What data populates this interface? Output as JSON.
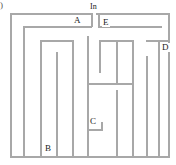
{
  "figure": {
    "corner_mark": ")",
    "entrance_label": "In"
  },
  "labels": [
    {
      "id": "A",
      "text": "A",
      "x": 73,
      "y": 16
    },
    {
      "id": "E",
      "text": "E",
      "x": 102,
      "y": 18
    },
    {
      "id": "D",
      "text": "D",
      "x": 161,
      "y": 43
    },
    {
      "id": "C",
      "text": "C",
      "x": 89,
      "y": 117
    },
    {
      "id": "B",
      "text": "B",
      "x": 44,
      "y": 144
    }
  ],
  "entrance": {
    "text": "In",
    "x": 89,
    "y": 3
  },
  "colors": {
    "wall": "#a8a8a8",
    "wall_light": "#c9c9c9",
    "background": "#ffffff",
    "text": "#1a1a1a"
  },
  "maze": {
    "type": "rectangular-maze",
    "width": 176,
    "height": 165,
    "outer_border": {
      "left": 10,
      "top": 13,
      "right": 170,
      "bottom": 158
    },
    "walls": [
      {
        "name": "outer-left",
        "orient": "v",
        "x": 10,
        "y": 13,
        "len": 145
      },
      {
        "name": "outer-top-left",
        "orient": "h",
        "x": 10,
        "y": 13,
        "len": 82
      },
      {
        "name": "outer-top-right",
        "orient": "h",
        "x": 96,
        "y": 13,
        "len": 74
      },
      {
        "name": "outer-right",
        "orient": "v",
        "x": 168,
        "y": 13,
        "len": 145
      },
      {
        "name": "outer-bottom",
        "orient": "h",
        "x": 10,
        "y": 156,
        "len": 160
      },
      {
        "name": "wall-a-horiz",
        "orient": "h",
        "x": 23,
        "y": 26,
        "len": 69
      },
      {
        "name": "wall-a-left",
        "orient": "v",
        "x": 23,
        "y": 26,
        "len": 130
      },
      {
        "name": "wall-a-right",
        "orient": "v",
        "x": 91,
        "y": 13,
        "len": 14
      },
      {
        "name": "wall-e-horiz",
        "orient": "h",
        "x": 98,
        "y": 26,
        "len": 64
      },
      {
        "name": "wall-e-left",
        "orient": "v",
        "x": 98,
        "y": 13,
        "len": 14
      },
      {
        "name": "wall-u-top",
        "orient": "h",
        "x": 40,
        "y": 40,
        "len": 33
      },
      {
        "name": "wall-u-left",
        "orient": "v",
        "x": 40,
        "y": 40,
        "len": 116
      },
      {
        "name": "wall-u-right",
        "orient": "v",
        "x": 72,
        "y": 40,
        "len": 116
      },
      {
        "name": "wall-u-mid",
        "orient": "v",
        "x": 56,
        "y": 52,
        "len": 104
      },
      {
        "name": "wall-center-v",
        "orient": "v",
        "x": 87,
        "y": 36,
        "len": 120
      },
      {
        "name": "wall-d-top",
        "orient": "h",
        "x": 99,
        "y": 40,
        "len": 34
      },
      {
        "name": "wall-d-left",
        "orient": "v",
        "x": 99,
        "y": 40,
        "len": 33
      },
      {
        "name": "wall-h-cross",
        "orient": "h",
        "x": 87,
        "y": 83,
        "len": 46
      },
      {
        "name": "wall-h-right-v",
        "orient": "v",
        "x": 116,
        "y": 40,
        "len": 44
      },
      {
        "name": "wall-col-1",
        "orient": "v",
        "x": 116,
        "y": 90,
        "len": 66
      },
      {
        "name": "wall-col-2",
        "orient": "v",
        "x": 132,
        "y": 40,
        "len": 116
      },
      {
        "name": "wall-col-3",
        "orient": "v",
        "x": 146,
        "y": 56,
        "len": 100
      },
      {
        "name": "wall-col-4",
        "orient": "v",
        "x": 158,
        "y": 40,
        "len": 116
      },
      {
        "name": "wall-d-horiz",
        "orient": "h",
        "x": 146,
        "y": 40,
        "len": 22
      },
      {
        "name": "wall-c-box-h",
        "orient": "h",
        "x": 87,
        "y": 129,
        "len": 16
      },
      {
        "name": "wall-c-box-v",
        "orient": "v",
        "x": 101,
        "y": 122,
        "len": 8
      },
      {
        "name": "wall-b-v",
        "orient": "v",
        "x": 56,
        "y": 104,
        "len": 52
      }
    ]
  }
}
